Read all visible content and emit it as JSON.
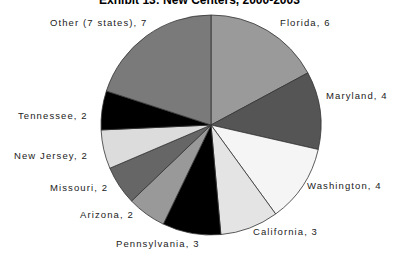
{
  "chart_data": {
    "type": "pie",
    "title": "Exhibit 13: New Centers, 2000-2003",
    "start_angle_deg": 0,
    "direction": "clockwise",
    "legend": "none (data labels on slices)",
    "categories": [
      "Florida",
      "Maryland",
      "Washington",
      "California",
      "Pennsylvania",
      "Arizona",
      "Missouri",
      "New Jersey",
      "Tennessee",
      "Other (7 states)"
    ],
    "values": [
      6,
      4,
      4,
      3,
      3,
      2,
      2,
      2,
      2,
      7
    ],
    "colors": [
      "#9a9a9a",
      "#555555",
      "#f5f5f5",
      "#e4e4e4",
      "#000000",
      "#999999",
      "#666666",
      "#dcdcdc",
      "#000000",
      "#7a7a7a"
    ],
    "labels": [
      {
        "text": "Florida, 6",
        "x": 280,
        "y": 17
      },
      {
        "text": "Maryland, 4",
        "x": 326,
        "y": 90
      },
      {
        "text": "Washington, 4",
        "x": 307,
        "y": 180
      },
      {
        "text": "California, 3",
        "x": 253,
        "y": 226
      },
      {
        "text": "Pennsylvania, 3",
        "x": 116,
        "y": 238
      },
      {
        "text": "Arizona, 2",
        "x": 80,
        "y": 209
      },
      {
        "text": "Missouri, 2",
        "x": 50,
        "y": 182
      },
      {
        "text": "New Jersey, 2",
        "x": 14,
        "y": 150
      },
      {
        "text": "Tennessee, 2",
        "x": 18,
        "y": 110
      },
      {
        "text": "Other (7 states), 7",
        "x": 50,
        "y": 17
      }
    ],
    "center": [
      211,
      125
    ],
    "radius": 110
  }
}
